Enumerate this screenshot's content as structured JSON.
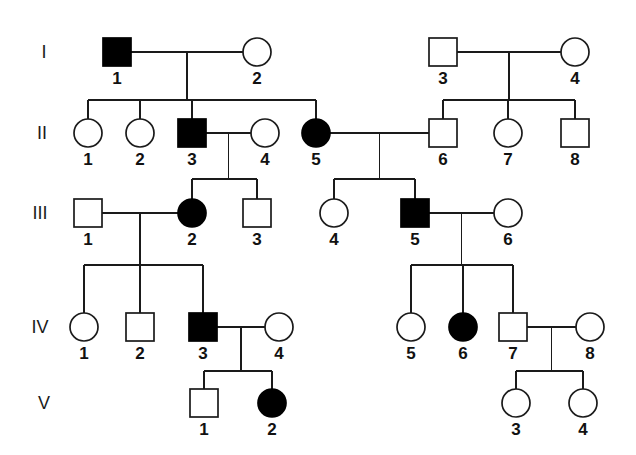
{
  "figure": {
    "kind": "pedigree-chart",
    "background_color": "#ffffff",
    "line_color": "#1a1a1a",
    "affected_fill": "#000000",
    "unaffected_fill": "#ffffff",
    "width": 636,
    "height": 455
  },
  "generations": [
    {
      "label": "I",
      "label_x": 44,
      "y": 52
    },
    {
      "label": "II",
      "label_x": 42,
      "y": 133
    },
    {
      "label": "III",
      "label_x": 40,
      "y": 213
    },
    {
      "label": "IV",
      "label_x": 40,
      "y": 327
    },
    {
      "label": "V",
      "label_x": 44,
      "y": 403
    }
  ],
  "individuals": [
    {
      "id": "I-1",
      "label": "1",
      "gen": "I",
      "sex": "male",
      "affected": true,
      "x": 117,
      "y": 52
    },
    {
      "id": "I-2",
      "label": "2",
      "gen": "I",
      "sex": "female",
      "affected": false,
      "x": 257,
      "y": 52
    },
    {
      "id": "I-3",
      "label": "3",
      "gen": "I",
      "sex": "male",
      "affected": false,
      "x": 443,
      "y": 52
    },
    {
      "id": "I-4",
      "label": "4",
      "gen": "I",
      "sex": "female",
      "affected": false,
      "x": 575,
      "y": 52
    },
    {
      "id": "II-1",
      "label": "1",
      "gen": "II",
      "sex": "female",
      "affected": false,
      "x": 88,
      "y": 133
    },
    {
      "id": "II-2",
      "label": "2",
      "gen": "II",
      "sex": "female",
      "affected": false,
      "x": 140,
      "y": 133
    },
    {
      "id": "II-3",
      "label": "3",
      "gen": "II",
      "sex": "male",
      "affected": true,
      "x": 192,
      "y": 133
    },
    {
      "id": "II-4",
      "label": "4",
      "gen": "II",
      "sex": "female",
      "affected": false,
      "x": 265,
      "y": 133
    },
    {
      "id": "II-5",
      "label": "5",
      "gen": "II",
      "sex": "female",
      "affected": true,
      "x": 316,
      "y": 133
    },
    {
      "id": "II-6",
      "label": "6",
      "gen": "II",
      "sex": "male",
      "affected": false,
      "x": 443,
      "y": 133
    },
    {
      "id": "II-7",
      "label": "7",
      "gen": "II",
      "sex": "female",
      "affected": false,
      "x": 508,
      "y": 133
    },
    {
      "id": "II-8",
      "label": "8",
      "gen": "II",
      "sex": "male",
      "affected": false,
      "x": 575,
      "y": 133
    },
    {
      "id": "III-1",
      "label": "1",
      "gen": "III",
      "sex": "male",
      "affected": false,
      "x": 88,
      "y": 213
    },
    {
      "id": "III-2",
      "label": "2",
      "gen": "III",
      "sex": "female",
      "affected": true,
      "x": 192,
      "y": 213
    },
    {
      "id": "III-3",
      "label": "3",
      "gen": "III",
      "sex": "male",
      "affected": false,
      "x": 257,
      "y": 213
    },
    {
      "id": "III-4",
      "label": "4",
      "gen": "III",
      "sex": "female",
      "affected": false,
      "x": 334,
      "y": 213
    },
    {
      "id": "III-5",
      "label": "5",
      "gen": "III",
      "sex": "male",
      "affected": true,
      "x": 415,
      "y": 213
    },
    {
      "id": "III-6",
      "label": "6",
      "gen": "III",
      "sex": "female",
      "affected": false,
      "x": 508,
      "y": 213
    },
    {
      "id": "IV-1",
      "label": "1",
      "gen": "IV",
      "sex": "female",
      "affected": false,
      "x": 84,
      "y": 327
    },
    {
      "id": "IV-2",
      "label": "2",
      "gen": "IV",
      "sex": "male",
      "affected": false,
      "x": 140,
      "y": 327
    },
    {
      "id": "IV-3",
      "label": "3",
      "gen": "IV",
      "sex": "male",
      "affected": true,
      "x": 203,
      "y": 327
    },
    {
      "id": "IV-4",
      "label": "4",
      "gen": "IV",
      "sex": "female",
      "affected": false,
      "x": 279,
      "y": 327
    },
    {
      "id": "IV-5",
      "label": "5",
      "gen": "IV",
      "sex": "female",
      "affected": false,
      "x": 411,
      "y": 327
    },
    {
      "id": "IV-6",
      "label": "6",
      "gen": "IV",
      "sex": "female",
      "affected": true,
      "x": 463,
      "y": 327
    },
    {
      "id": "IV-7",
      "label": "7",
      "gen": "IV",
      "sex": "male",
      "affected": false,
      "x": 513,
      "y": 327
    },
    {
      "id": "IV-8",
      "label": "8",
      "gen": "IV",
      "sex": "female",
      "affected": false,
      "x": 590,
      "y": 327
    },
    {
      "id": "V-1",
      "label": "1",
      "gen": "V",
      "sex": "male",
      "affected": false,
      "x": 204,
      "y": 403
    },
    {
      "id": "V-2",
      "label": "2",
      "gen": "V",
      "sex": "female",
      "affected": true,
      "x": 272,
      "y": 403
    },
    {
      "id": "V-3",
      "label": "3",
      "gen": "V",
      "sex": "female",
      "affected": false,
      "x": 516,
      "y": 403
    },
    {
      "id": "V-4",
      "label": "4",
      "gen": "V",
      "sex": "female",
      "affected": false,
      "x": 583,
      "y": 403
    }
  ],
  "matings": [
    {
      "id": "m1",
      "partners": [
        "I-1",
        "I-2"
      ],
      "children": [
        "II-1",
        "II-2",
        "II-3",
        "II-5"
      ]
    },
    {
      "id": "m2",
      "partners": [
        "I-3",
        "I-4"
      ],
      "children": [
        "II-6",
        "II-7",
        "II-8"
      ]
    },
    {
      "id": "m3",
      "partners": [
        "II-3",
        "II-4"
      ],
      "children": [
        "III-2",
        "III-3"
      ]
    },
    {
      "id": "m4",
      "partners": [
        "II-5",
        "II-6"
      ],
      "children": [
        "III-4",
        "III-5"
      ]
    },
    {
      "id": "m5",
      "partners": [
        "III-1",
        "III-2"
      ],
      "children": [
        "IV-1",
        "IV-2",
        "IV-3"
      ]
    },
    {
      "id": "m6",
      "partners": [
        "III-5",
        "III-6"
      ],
      "children": [
        "IV-5",
        "IV-6",
        "IV-7"
      ]
    },
    {
      "id": "m7",
      "partners": [
        "IV-3",
        "IV-4"
      ],
      "children": [
        "V-1",
        "V-2"
      ]
    },
    {
      "id": "m8",
      "partners": [
        "IV-7",
        "IV-8"
      ],
      "children": [
        "V-3",
        "V-4"
      ]
    }
  ],
  "geometry": {
    "square_size": 28,
    "circle_radius": 14,
    "id_label_dy": 32,
    "mating_drop": 16,
    "sib_bar_offsets": {
      "m1": 32,
      "m2": 32,
      "m3": 30,
      "m4": 30,
      "m5": 36,
      "m6": 36,
      "m7": 28,
      "m8": 28
    }
  }
}
